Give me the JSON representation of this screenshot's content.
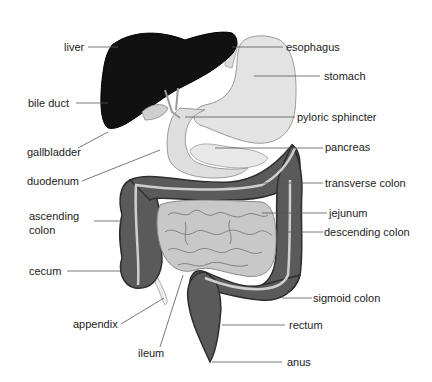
{
  "diagram": {
    "colors": {
      "liver": "#111111",
      "stomach": "#e3e3e3",
      "outline": "#9a9a9a",
      "colon": "#5a5a5a",
      "colon_dark": "#2e2e2e",
      "small_intestine": "#c8c8c8",
      "colon_stripe": "#cfcfcf",
      "leader_line": "#555555",
      "label_text": "#222222"
    },
    "labels": {
      "liver": "liver",
      "bile_duct": "bile duct",
      "gallbladder": "gallbladder",
      "duodenum": "duodenum",
      "ascending_colon_1": "ascending",
      "ascending_colon_2": "colon",
      "cecum": "cecum",
      "appendix": "appendix",
      "ileum": "ileum",
      "esophagus": "esophagus",
      "stomach": "stomach",
      "pyloric_sphincter": "pyloric sphincter",
      "pancreas": "pancreas",
      "transverse_colon": "transverse colon",
      "jejunum": "jejunum",
      "descending_colon": "descending colon",
      "sigmoid_colon": "sigmoid colon",
      "rectum": "rectum",
      "anus": "anus"
    }
  }
}
